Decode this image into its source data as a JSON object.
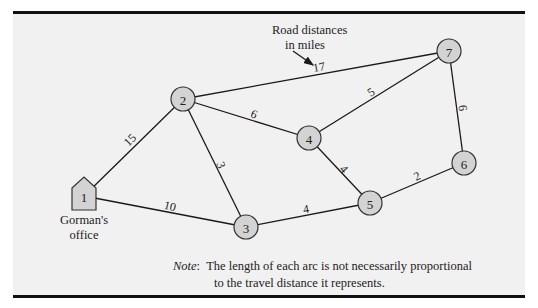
{
  "diagram": {
    "type": "network",
    "annotation": {
      "lines": [
        "Road distances",
        "in miles"
      ],
      "points_to_edge": "2-7"
    },
    "nodes": [
      {
        "id": "1",
        "label": "1",
        "shape": "house",
        "caption": [
          "Gorman's",
          "office"
        ]
      },
      {
        "id": "2",
        "label": "2",
        "shape": "circle"
      },
      {
        "id": "3",
        "label": "3",
        "shape": "circle"
      },
      {
        "id": "4",
        "label": "4",
        "shape": "circle"
      },
      {
        "id": "5",
        "label": "5",
        "shape": "circle"
      },
      {
        "id": "6",
        "label": "6",
        "shape": "circle"
      },
      {
        "id": "7",
        "label": "7",
        "shape": "circle"
      }
    ],
    "edges": [
      {
        "from": "1",
        "to": "2",
        "distance": "15"
      },
      {
        "from": "1",
        "to": "3",
        "distance": "10"
      },
      {
        "from": "2",
        "to": "3",
        "distance": "3"
      },
      {
        "from": "2",
        "to": "4",
        "distance": "6"
      },
      {
        "from": "2",
        "to": "7",
        "distance": "17"
      },
      {
        "from": "3",
        "to": "5",
        "distance": "4"
      },
      {
        "from": "4",
        "to": "5",
        "distance": "4"
      },
      {
        "from": "4",
        "to": "7",
        "distance": "5"
      },
      {
        "from": "5",
        "to": "6",
        "distance": "2"
      },
      {
        "from": "6",
        "to": "7",
        "distance": "6"
      }
    ],
    "note": {
      "label": "Note",
      "separator": ":",
      "line1": "The length of each arc is not necessarily proportional",
      "line2": "to the travel distance it represents."
    },
    "colors": {
      "node_fill": "#d3d3d3",
      "node_stroke": "#333333",
      "edge": "#1a1a1a",
      "background": "#f1f1f1",
      "rule": "#111111"
    }
  }
}
